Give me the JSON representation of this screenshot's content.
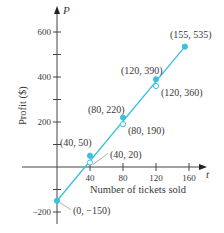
{
  "chart_data": {
    "type": "scatter",
    "title": "",
    "xlabel": "Number of tickets sold",
    "ylabel": "Profit ($)",
    "x_axis_symbol": "t",
    "y_axis_symbol": "P",
    "xlim": [
      -30,
      175
    ],
    "ylim": [
      -240,
      680
    ],
    "x_ticks": [
      40,
      80,
      120,
      160
    ],
    "x_tick_labels": [
      "40",
      "80",
      "120",
      "160"
    ],
    "y_ticks": [
      -200,
      -100,
      100,
      200,
      300,
      400,
      500,
      600
    ],
    "y_tick_labels": [
      {
        "value": 600,
        "label": "600"
      },
      {
        "value": 400,
        "label": "400"
      },
      {
        "value": 200,
        "label": "200"
      },
      {
        "value": -200,
        "label": "−200"
      }
    ],
    "grid": false,
    "line_color": "#3cc0e0",
    "series": [
      {
        "name": "Data points",
        "marker": "filled",
        "points": [
          {
            "x": 0,
            "y": -150,
            "label": "(0, −150)"
          },
          {
            "x": 40,
            "y": 50,
            "label": "(40, 50)"
          },
          {
            "x": 80,
            "y": 220,
            "label": "(80, 220)"
          },
          {
            "x": 120,
            "y": 390,
            "label": "(120, 390)"
          },
          {
            "x": 155,
            "y": 535,
            "label": "(155, 535)"
          }
        ]
      },
      {
        "name": "Line values",
        "marker": "hollow",
        "points": [
          {
            "x": 40,
            "y": 20,
            "label": "(40, 20)"
          },
          {
            "x": 80,
            "y": 190,
            "label": "(80, 190)"
          },
          {
            "x": 120,
            "y": 360,
            "label": "(120, 360)"
          }
        ]
      },
      {
        "name": "Linear model",
        "type": "line",
        "from": {
          "x": 0,
          "y": -150
        },
        "to": {
          "x": 155,
          "y": 535
        }
      }
    ]
  }
}
